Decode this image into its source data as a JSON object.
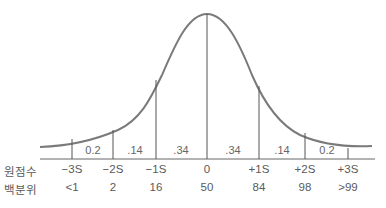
{
  "diagram": {
    "title": "",
    "type": "normal-distribution",
    "row_labels": {
      "raw_score": "원점수",
      "percentile": "백분위"
    },
    "boundaries": [
      {
        "sd": "−3S",
        "percentile": "<1",
        "x": 72,
        "y_top": 139
      },
      {
        "sd": "−2S",
        "percentile": "2",
        "x": 113,
        "y_top": 130
      },
      {
        "sd": "−1S",
        "percentile": "16",
        "x": 156,
        "y_top": 80
      },
      {
        "sd": "0",
        "percentile": "50",
        "x": 207,
        "y_top": 14
      },
      {
        "sd": "+1S",
        "percentile": "84",
        "x": 259,
        "y_top": 86
      },
      {
        "sd": "+2S",
        "percentile": "98",
        "x": 305,
        "y_top": 133
      },
      {
        "sd": "+3S",
        "percentile": ">99",
        "x": 348,
        "y_top": 148
      }
    ],
    "segments": [
      {
        "label": "0.2",
        "x": 93
      },
      {
        "label": ".14",
        "x": 135
      },
      {
        "label": ".34",
        "x": 181
      },
      {
        "label": ".34",
        "x": 233
      },
      {
        "label": ".14",
        "x": 282
      },
      {
        "label": "0.2",
        "x": 327
      }
    ],
    "colors": {
      "curve": "#7a7a7a",
      "lines": "#555555",
      "text": "#5a5a5a"
    }
  }
}
